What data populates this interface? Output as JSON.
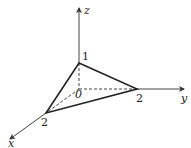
{
  "diagram": {
    "type": "3d-coordinate-plane-intercepts",
    "axes": {
      "x": {
        "label": "x"
      },
      "y": {
        "label": "y"
      },
      "z": {
        "label": "z"
      }
    },
    "origin_label": "0",
    "intercepts": {
      "x": "2",
      "y": "2",
      "z": "1"
    },
    "colors": {
      "stroke": "#222222",
      "axis": "#444444",
      "background": "#ffffff"
    }
  }
}
